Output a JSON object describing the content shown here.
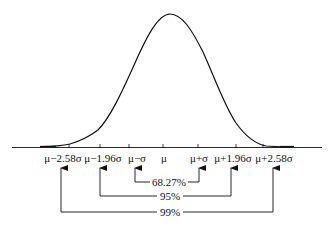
{
  "diagram": {
    "type": "normal-distribution",
    "axis_labels": [
      {
        "text": "μ−2.58σ",
        "x": 69
      },
      {
        "text": "μ−1.96σ",
        "x": 100
      },
      {
        "text": "μ−σ",
        "x": 130
      },
      {
        "text": "μ",
        "x": 163
      },
      {
        "text": "μ+σ",
        "x": 199
      },
      {
        "text": "μ+1.96σ",
        "x": 232
      },
      {
        "text": "μ+2.58σ",
        "x": 272
      }
    ],
    "intervals": [
      {
        "label": "68.27%",
        "from": "μ−σ",
        "to": "μ+σ"
      },
      {
        "label": "95%",
        "from": "μ−1.96σ",
        "to": "μ+1.96σ"
      },
      {
        "label": "99%",
        "from": "μ−2.58σ",
        "to": "μ+2.58σ"
      }
    ]
  }
}
